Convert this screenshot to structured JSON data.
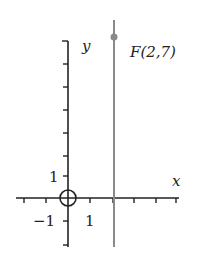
{
  "diagram": {
    "type": "coordinate-plane",
    "axes": {
      "x_label": "x",
      "y_label": "y",
      "x_tick_label_pos": "1",
      "x_tick_label_neg": "−1",
      "y_tick_label": "1"
    },
    "origin_marker": "circle-crosshair",
    "vertical_line": {
      "x": 2,
      "color": "#8a8a8a"
    },
    "point": {
      "name": "F",
      "x": 2,
      "y": 7,
      "label": "F(2,7)",
      "color": "#8a8a8a"
    },
    "colors": {
      "axis": "#222222",
      "line": "#8a8a8a",
      "background": "#ffffff"
    }
  }
}
